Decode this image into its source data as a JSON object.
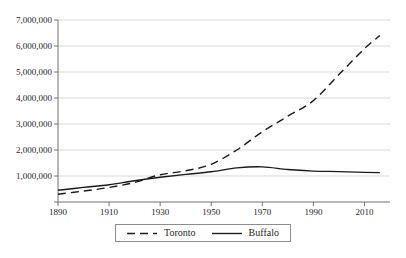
{
  "figure": {
    "background": "#ffffff"
  },
  "chart_data": {
    "type": "line",
    "title": "",
    "xlabel": "",
    "ylabel": "",
    "x": [
      1890,
      1900,
      1910,
      1920,
      1930,
      1940,
      1950,
      1960,
      1970,
      1980,
      1990,
      2000,
      2010,
      2016
    ],
    "series": [
      {
        "name": "Toronto",
        "line_style": "dashed",
        "values": [
          300000,
          420000,
          560000,
          750000,
          1050000,
          1200000,
          1450000,
          2000000,
          2700000,
          3300000,
          3900000,
          4900000,
          5900000,
          6400000
        ]
      },
      {
        "name": "Buffalo",
        "line_style": "solid",
        "values": [
          450000,
          560000,
          660000,
          820000,
          950000,
          1060000,
          1160000,
          1310000,
          1350000,
          1250000,
          1190000,
          1170000,
          1140000,
          1130000
        ]
      }
    ],
    "xlim": [
      1890,
      2020
    ],
    "ylim": [
      0,
      7000000
    ],
    "x_ticks": [
      {
        "value": 1890,
        "label": "1890"
      },
      {
        "value": 1910,
        "label": "1910"
      },
      {
        "value": 1930,
        "label": "1930"
      },
      {
        "value": 1950,
        "label": "1950"
      },
      {
        "value": 1970,
        "label": "1970"
      },
      {
        "value": 1990,
        "label": "1990"
      },
      {
        "value": 2010,
        "label": "2010"
      }
    ],
    "y_ticks": [
      {
        "value": 0,
        "label": ""
      },
      {
        "value": 1000000,
        "label": "1,000,000"
      },
      {
        "value": 2000000,
        "label": "2,000,000"
      },
      {
        "value": 3000000,
        "label": "3,000,000"
      },
      {
        "value": 4000000,
        "label": "4,000,000"
      },
      {
        "value": 5000000,
        "label": "5,000,000"
      },
      {
        "value": 6000000,
        "label": "6,000,000"
      },
      {
        "value": 7000000,
        "label": "7,000,000"
      }
    ],
    "grid": "horizontal",
    "legend_position": "bottom-center",
    "colors": {
      "series": "#1a1a1a",
      "grid": "#d9d9d9",
      "axis": "#737373",
      "text": "#262626"
    }
  }
}
